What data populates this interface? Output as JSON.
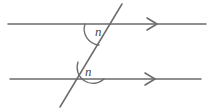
{
  "diagram": {
    "background_color": "#ffffff",
    "stroke_color": "#6b6b6b",
    "label_color": "#4a4a4a",
    "stroke_width": 1.5,
    "lines": [
      {
        "name": "top-parallel-line",
        "x1": 8,
        "y1": 24,
        "x2": 206,
        "y2": 24,
        "marker": "single-chevron-right"
      },
      {
        "name": "bottom-parallel-line",
        "x1": 10,
        "y1": 79,
        "x2": 201,
        "y2": 79,
        "marker": "single-chevron-right"
      },
      {
        "name": "transversal-line",
        "x1": 60,
        "y1": 107,
        "x2": 122,
        "y2": 4,
        "marker": "none"
      }
    ],
    "arrows": [
      {
        "name": "top-line-arrow",
        "cx": 152,
        "cy": 24,
        "width": 10,
        "height": 12
      },
      {
        "name": "bottom-line-arrow",
        "cx": 150,
        "cy": 79,
        "width": 10,
        "height": 12
      }
    ],
    "angles": [
      {
        "name": "upper-angle-n",
        "label": "n",
        "label_x": 99,
        "label_y": 36,
        "arc_path": "M 85 24 A 16 16 0 0 0 99 45",
        "vertex_x": 101,
        "vertex_y": 24
      },
      {
        "name": "lower-angle-n",
        "label": "n",
        "label_x": 89,
        "label_y": 76,
        "arc_path": "M 78 62 A 16 16 0 0 0 104 79",
        "vertex_x": 88,
        "vertex_y": 79
      }
    ]
  }
}
